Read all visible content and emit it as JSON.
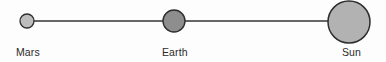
{
  "figure": {
    "kind": "astronomy-alignment-diagram",
    "background_color": "#fdfdfd",
    "width": 386,
    "height": 62,
    "axis_line": {
      "name": "connecting-line",
      "x1": 27,
      "y1": 21,
      "x2": 349,
      "y2": 21,
      "color": "#333333",
      "width": 1.6
    },
    "bodies": [
      {
        "id": "mars",
        "label": "Mars",
        "cx": 27,
        "cy": 21,
        "r": 7,
        "fill": "#bdbdbd",
        "stroke": "#2e2e2e",
        "stroke_width": 1.3,
        "label_x": 16,
        "label_y": 46
      },
      {
        "id": "earth",
        "label": "Earth",
        "cx": 174,
        "cy": 21,
        "r": 11,
        "fill": "#8e8e8e",
        "stroke": "#2e2e2e",
        "stroke_width": 1.4,
        "label_x": 162,
        "label_y": 46
      },
      {
        "id": "sun",
        "label": "Sun",
        "cx": 349,
        "cy": 22,
        "r": 21,
        "fill": "#b2b2b2",
        "stroke": "#2e2e2e",
        "stroke_width": 1.5,
        "label_x": 342,
        "label_y": 46
      }
    ]
  },
  "chart_data": {
    "type": "scatter",
    "title": "",
    "subtitle": "",
    "xlabel": "",
    "ylabel": "",
    "grid": false,
    "legend": false,
    "orientation": "horizontal",
    "categories": [
      "Mars",
      "Earth",
      "Sun"
    ],
    "x": [
      27,
      174,
      349
    ],
    "y": [
      21,
      21,
      22
    ],
    "marker_radii": [
      7,
      11,
      21
    ],
    "marker_fills": [
      "#bdbdbd",
      "#8e8e8e",
      "#b2b2b2"
    ],
    "xlim": [
      0,
      386
    ],
    "ylim": [
      0,
      62
    ],
    "annotations": [
      {
        "text": "Mars",
        "x": 16,
        "y": 46
      },
      {
        "text": "Earth",
        "x": 162,
        "y": 46
      },
      {
        "text": "Sun",
        "x": 342,
        "y": 46
      }
    ]
  }
}
